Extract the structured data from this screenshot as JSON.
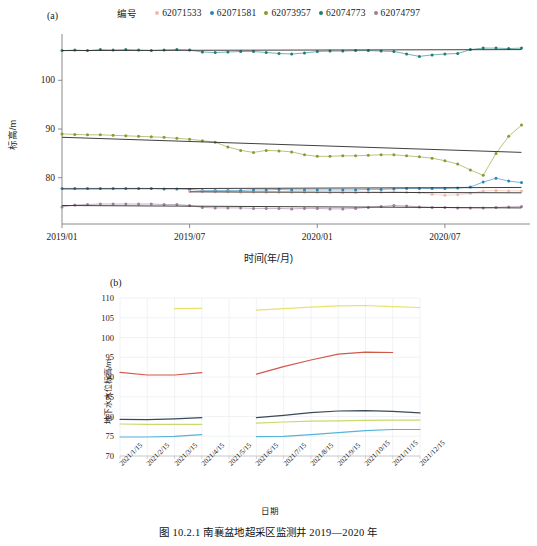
{
  "figure": {
    "caption": "图 10.2.1  南襄盆地超采区监测井 2019—2020 年",
    "panel_a_tag": "(a)",
    "panel_b_tag": "(b)"
  },
  "legend": {
    "title": "编号",
    "items": [
      {
        "label": "62071533",
        "color": "#f2b9ae",
        "marker": "dot"
      },
      {
        "label": "62071581",
        "color": "#2e86b6",
        "marker": "dot"
      },
      {
        "label": "62073957",
        "color": "#8a9a2e",
        "marker": "dot"
      },
      {
        "label": "62074773",
        "color": "#1a7f77",
        "marker": "dot"
      },
      {
        "label": "62074797",
        "color": "#9b7f99",
        "marker": "dot"
      }
    ]
  },
  "chart_data": [
    {
      "id": "panel-a",
      "type": "scatter",
      "title": "",
      "xlabel": "时间(年/月)",
      "ylabel": "标高/m",
      "xticks": [
        "2019/01",
        "2019/07",
        "2020/01",
        "2020/07"
      ],
      "xtick_positions": [
        0,
        6,
        12,
        18
      ],
      "xlim": [
        0,
        22
      ],
      "ylim": [
        70.5,
        109.5
      ],
      "yticks": [
        80,
        90,
        100
      ],
      "grid": false,
      "trendlines": true,
      "series": [
        {
          "name": "62074773",
          "color": "#1a7f77",
          "x": [
            0,
            0.6,
            1.2,
            1.8,
            2.4,
            3,
            3.6,
            4.2,
            4.8,
            5.4,
            6,
            6.6,
            7.2,
            7.8,
            8.4,
            9,
            9.6,
            10.2,
            10.8,
            11.4,
            12,
            12.6,
            13.2,
            13.8,
            14.4,
            15,
            15.6,
            16.2,
            16.8,
            17.4,
            18,
            18.6,
            19.2,
            19.8,
            20.4,
            21,
            21.6
          ],
          "y": [
            106.1,
            106.2,
            106.1,
            106.3,
            106.2,
            106.3,
            106.2,
            106.1,
            106.2,
            106.3,
            106.2,
            105.8,
            105.7,
            105.8,
            105.9,
            105.9,
            105.7,
            105.5,
            105.4,
            105.6,
            105.9,
            106.0,
            106.0,
            106.1,
            106.1,
            106.0,
            105.9,
            105.4,
            104.9,
            105.2,
            105.4,
            105.5,
            106.3,
            106.6,
            106.6,
            106.5,
            106.6
          ],
          "trend": {
            "y0": 106.1,
            "y1": 106.3
          }
        },
        {
          "name": "62073957",
          "color": "#8a9a2e",
          "x": [
            0,
            0.6,
            1.2,
            1.8,
            2.4,
            3,
            3.6,
            4.2,
            4.8,
            5.4,
            6,
            6.6,
            7.2,
            7.8,
            8.4,
            9,
            9.6,
            10.2,
            10.8,
            11.4,
            12,
            12.6,
            13.2,
            13.8,
            14.4,
            15,
            15.6,
            16.2,
            16.8,
            17.4,
            18,
            18.6,
            19.2,
            19.8,
            20.4,
            21,
            21.6
          ],
          "y": [
            89.0,
            88.9,
            88.8,
            88.8,
            88.7,
            88.6,
            88.5,
            88.4,
            88.3,
            88.1,
            87.9,
            87.6,
            87.3,
            86.3,
            85.6,
            85.2,
            85.6,
            85.5,
            85.3,
            84.7,
            84.4,
            84.4,
            84.5,
            84.5,
            84.6,
            84.7,
            84.7,
            84.5,
            84.3,
            84.0,
            83.5,
            82.8,
            81.6,
            80.5,
            85.0,
            88.5,
            90.8
          ],
          "trend": {
            "y0": 88.3,
            "y1": 85.2
          }
        },
        {
          "name": "62071581",
          "color": "#2e86b6",
          "x": [
            0,
            0.6,
            1.2,
            1.8,
            2.4,
            3,
            3.6,
            4.2,
            4.8,
            5.4,
            6,
            6.6,
            7.2,
            7.8,
            8.4,
            9,
            9.6,
            10.2,
            10.8,
            11.4,
            12,
            12.6,
            13.2,
            13.8,
            14.4,
            15,
            15.6,
            16.2,
            16.8,
            17.4,
            18,
            18.6,
            19.2,
            19.8,
            20.4,
            21,
            21.6
          ],
          "y": [
            77.8,
            77.8,
            77.8,
            77.8,
            77.8,
            77.8,
            77.8,
            77.8,
            77.7,
            77.7,
            77.6,
            77.4,
            77.4,
            77.4,
            77.4,
            77.5,
            77.5,
            77.6,
            77.5,
            77.5,
            77.5,
            77.5,
            77.5,
            77.5,
            77.6,
            77.6,
            77.7,
            77.8,
            77.8,
            77.8,
            77.8,
            77.9,
            78.1,
            79.1,
            79.9,
            79.3,
            79.0
          ],
          "trend": {
            "y0": 77.7,
            "y1": 78.0
          }
        },
        {
          "name": "62071533",
          "color": "#f2b9ae",
          "x": [
            6,
            6.6,
            7.2,
            7.8,
            8.4,
            9,
            9.6,
            10.2,
            10.8,
            11.4,
            12,
            12.6,
            13.2,
            13.8,
            14.4,
            15,
            15.6,
            16.2,
            16.8,
            17.4,
            18,
            18.6,
            19.2,
            19.8,
            20.4,
            21,
            21.6
          ],
          "y": [
            77.2,
            77.2,
            77.1,
            77.1,
            77.0,
            77.0,
            77.0,
            77.0,
            77.0,
            77.0,
            77.0,
            76.9,
            76.9,
            76.9,
            77.0,
            77.0,
            77.1,
            77.0,
            76.9,
            76.6,
            76.4,
            76.5,
            76.8,
            77.3,
            77.4,
            77.3,
            77.3
          ],
          "trend": {
            "y0": 77.1,
            "y1": 76.9
          }
        },
        {
          "name": "62074797",
          "color": "#9b7f99",
          "x": [
            0,
            0.6,
            1.2,
            1.8,
            2.4,
            3,
            3.6,
            4.2,
            4.8,
            5.4,
            6,
            6.6,
            7.2,
            7.8,
            8.4,
            9,
            9.6,
            10.2,
            10.8,
            11.4,
            12,
            12.6,
            13.2,
            13.8,
            14.4,
            15,
            15.6,
            16.2,
            16.8,
            17.4,
            18,
            18.6,
            19.2,
            19.8,
            20.4,
            21,
            21.6
          ],
          "y": [
            74.0,
            74.4,
            74.5,
            74.6,
            74.6,
            74.6,
            74.6,
            74.6,
            74.5,
            74.5,
            74.3,
            73.9,
            73.8,
            73.8,
            73.8,
            73.7,
            73.7,
            73.7,
            73.6,
            73.7,
            73.7,
            73.6,
            73.6,
            73.7,
            73.9,
            74.1,
            74.3,
            74.2,
            74.0,
            73.9,
            73.9,
            73.8,
            73.8,
            73.8,
            73.9,
            74.0,
            74.1
          ],
          "trend": {
            "y0": 74.3,
            "y1": 73.8
          }
        }
      ]
    },
    {
      "id": "panel-b",
      "type": "line",
      "title": "",
      "xlabel": "日期",
      "ylabel": "地下水水位标高/m",
      "categories": [
        "2021/1/15",
        "2021/2/15",
        "2021/3/15",
        "2021/4/15",
        "2021/5/15",
        "2021/6/15",
        "2021/7/15",
        "2021/8/15",
        "2021/9/15",
        "2021/10/15",
        "2021/11/15",
        "2021/12/15"
      ],
      "yticks": [
        70,
        75,
        80,
        85,
        90,
        95,
        100,
        105,
        110
      ],
      "ylim": [
        70,
        110
      ],
      "grid": true,
      "series": [
        {
          "name": "62074773",
          "color": "#e8e26a",
          "values": [
            null,
            null,
            107.3,
            107.4,
            null,
            106.9,
            107.3,
            107.7,
            108.0,
            108.1,
            107.8,
            107.6
          ]
        },
        {
          "name": "62073957",
          "color": "#d2584a",
          "values": [
            91.2,
            90.5,
            90.5,
            91.1,
            null,
            90.7,
            92.6,
            94.3,
            95.8,
            96.3,
            96.2,
            null
          ]
        },
        {
          "name": "62071581",
          "color": "#3b4a56",
          "values": [
            79.3,
            79.2,
            79.4,
            79.7,
            null,
            79.7,
            80.3,
            81.0,
            81.4,
            81.5,
            81.3,
            80.9
          ]
        },
        {
          "name": "62071533",
          "color": "#c9d96b",
          "values": [
            78.1,
            78.0,
            78.0,
            78.0,
            null,
            78.3,
            78.6,
            78.8,
            78.9,
            79.0,
            79.1,
            79.1
          ]
        },
        {
          "name": "62074797",
          "color": "#56b4d9",
          "values": [
            74.8,
            74.8,
            75.0,
            75.4,
            null,
            74.9,
            75.0,
            75.4,
            75.9,
            76.4,
            76.7,
            76.7
          ]
        }
      ]
    }
  ]
}
